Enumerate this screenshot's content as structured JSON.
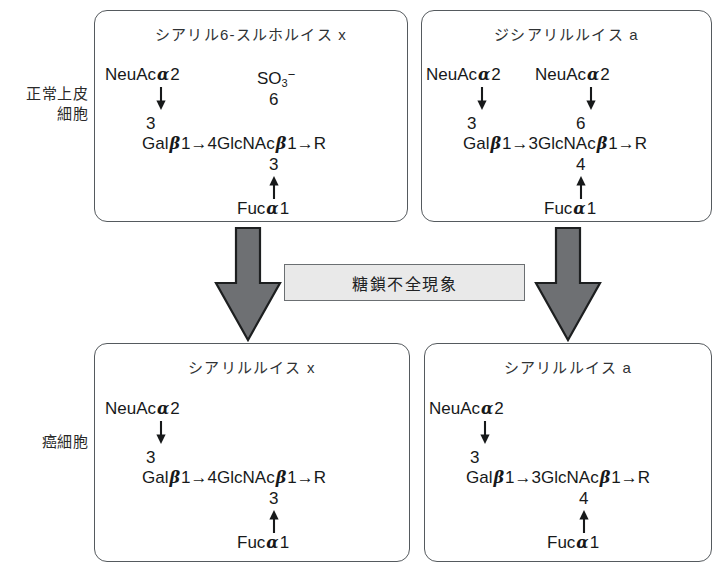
{
  "figure": {
    "row_labels": {
      "normal": "正常上皮\n細胞",
      "cancer": "癌細胞"
    },
    "center_caption": "糖鎖不全現象",
    "colors": {
      "arrow_fill": "#6e7073",
      "arrow_stroke": "#1d1f20",
      "box_border": "#555a5e",
      "caption_bg": "#e9e9e9",
      "text": "#17191a"
    }
  },
  "boxes": {
    "top_left": {
      "title": "シアリル6-スルホルイス x",
      "branch_upper": {
        "donor": "NeuAc",
        "donor_greek": "α",
        "donor_pos": "2",
        "link_num": "3"
      },
      "sulfate": {
        "label": "SO",
        "sub": "3",
        "sup": "−",
        "link_num": "6"
      },
      "backbone": {
        "res1": "Gal",
        "res1_greek": "β",
        "res1_pos": "1",
        "arrow1": "→",
        "link1": "4",
        "res2": "GlcNAc",
        "res2_greek": "β",
        "res2_pos": "1",
        "arrow2": "→",
        "terminus": "R"
      },
      "branch_lower": {
        "link_num": "3",
        "donor": "Fuc",
        "donor_greek": "α",
        "donor_pos": "1"
      }
    },
    "top_right": {
      "title": "ジシアリルルイス a",
      "branch_upper_left": {
        "donor": "NeuAc",
        "donor_greek": "α",
        "donor_pos": "2",
        "link_num": "3"
      },
      "branch_upper_right": {
        "donor": "NeuAc",
        "donor_greek": "α",
        "donor_pos": "2",
        "link_num": "6"
      },
      "backbone": {
        "res1": "Gal",
        "res1_greek": "β",
        "res1_pos": "1",
        "arrow1": "→",
        "link1": "3",
        "res2": "GlcNAc",
        "res2_greek": "β",
        "res2_pos": "1",
        "arrow2": "→",
        "terminus": "R"
      },
      "branch_lower": {
        "link_num": "4",
        "donor": "Fuc",
        "donor_greek": "α",
        "donor_pos": "1"
      }
    },
    "bottom_left": {
      "title": "シアリルルイス x",
      "branch_upper": {
        "donor": "NeuAc",
        "donor_greek": "α",
        "donor_pos": "2",
        "link_num": "3"
      },
      "backbone": {
        "res1": "Gal",
        "res1_greek": "β",
        "res1_pos": "1",
        "arrow1": "→",
        "link1": "4",
        "res2": "GlcNAc",
        "res2_greek": "β",
        "res2_pos": "1",
        "arrow2": "→",
        "terminus": "R"
      },
      "branch_lower": {
        "link_num": "3",
        "donor": "Fuc",
        "donor_greek": "α",
        "donor_pos": "1"
      }
    },
    "bottom_right": {
      "title": "シアリルルイス a",
      "branch_upper": {
        "donor": "NeuAc",
        "donor_greek": "α",
        "donor_pos": "2",
        "link_num": "3"
      },
      "backbone": {
        "res1": "Gal",
        "res1_greek": "β",
        "res1_pos": "1",
        "arrow1": "→",
        "link1": "3",
        "res2": "GlcNAc",
        "res2_greek": "β",
        "res2_pos": "1",
        "arrow2": "→",
        "terminus": "R"
      },
      "branch_lower": {
        "link_num": "4",
        "donor": "Fuc",
        "donor_greek": "α",
        "donor_pos": "1"
      }
    }
  }
}
